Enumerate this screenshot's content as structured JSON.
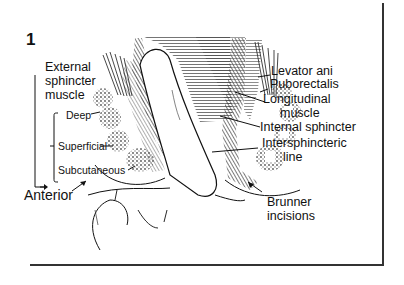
{
  "figure": {
    "number": "1",
    "left_labels": {
      "group_title_line1": "External",
      "group_title_line2": "sphincter",
      "group_title_line3": "muscle",
      "deep": "Deep",
      "superficial": "Superficial",
      "subcutaneous": "Subcutaneous",
      "anterior": "Anterior"
    },
    "right_labels": {
      "levator_ani": "Levator ani",
      "puborectalis": "Puborectalis",
      "longitudinal_line1": "Longitudinal",
      "longitudinal_line2": "muscle",
      "internal_sphincter": "Internal sphincter",
      "intersphincteric_line1": "Intersphincteric",
      "intersphincteric_line2": "line",
      "brunner_line1": "Brunner",
      "brunner_line2": "incisions"
    },
    "colors": {
      "ink": "#111111",
      "frame": "#333333",
      "shade": "#8a8a8a",
      "background": "#ffffff"
    }
  }
}
